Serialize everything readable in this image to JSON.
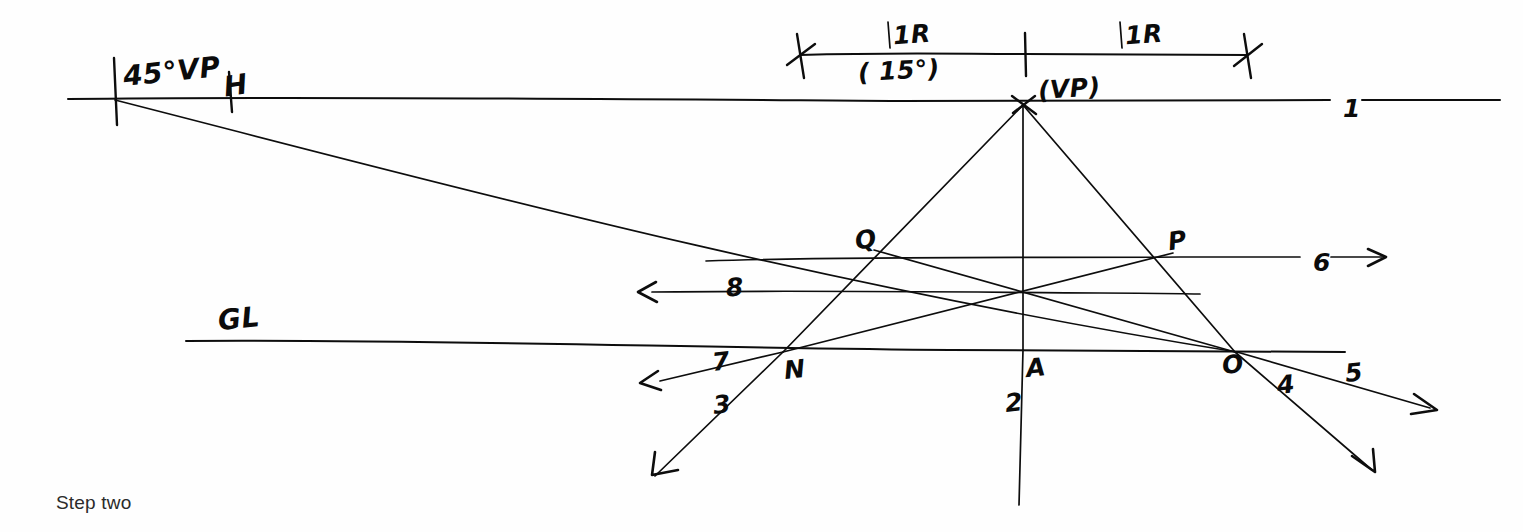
{
  "page": {
    "caption": "Step two",
    "caption_pos": {
      "x": 56,
      "y": 492
    },
    "width": 1523,
    "height": 532,
    "background": "#ffffff",
    "ink_color": "#0d0d0d"
  },
  "chart_data": {
    "type": "diagram",
    "title": "Step two",
    "labels": [
      {
        "id": "vp45",
        "text": "45°VP",
        "x": 123,
        "y": 58,
        "size": "lg",
        "rot": -6
      },
      {
        "id": "horizon_h",
        "text": "H",
        "x": 224,
        "y": 72,
        "size": "lg",
        "rot": -8
      },
      {
        "id": "measure_1r_left",
        "text": "1R",
        "x": 893,
        "y": 22,
        "size": "md",
        "rot": -4
      },
      {
        "id": "measure_15deg",
        "text": "( 15°)",
        "x": 858,
        "y": 58,
        "size": "md",
        "rot": -3
      },
      {
        "id": "measure_1r_right",
        "text": "1R",
        "x": 1125,
        "y": 22,
        "size": "md",
        "rot": -4
      },
      {
        "id": "vp_main",
        "text": "(VP)",
        "x": 1038,
        "y": 76,
        "size": "md",
        "rot": -4
      },
      {
        "id": "horizon_num",
        "text": "1",
        "x": 1343,
        "y": 96,
        "size": "md",
        "rot": 0
      },
      {
        "id": "point_q",
        "text": "Q",
        "x": 855,
        "y": 227,
        "size": "md",
        "rot": -8
      },
      {
        "id": "point_p",
        "text": "P",
        "x": 1168,
        "y": 228,
        "size": "md",
        "rot": -8
      },
      {
        "id": "line_6",
        "text": "6",
        "x": 1313,
        "y": 250,
        "size": "md",
        "rot": 0
      },
      {
        "id": "line_8",
        "text": "8",
        "x": 726,
        "y": 275,
        "size": "md",
        "rot": -4
      },
      {
        "id": "ground_line_gl",
        "text": "GL",
        "x": 218,
        "y": 305,
        "size": "lg",
        "rot": -6
      },
      {
        "id": "line_7",
        "text": "7",
        "x": 712,
        "y": 349,
        "size": "md",
        "rot": -6
      },
      {
        "id": "point_n",
        "text": "N",
        "x": 784,
        "y": 357,
        "size": "md",
        "rot": -6
      },
      {
        "id": "point_a",
        "text": "A",
        "x": 1026,
        "y": 355,
        "size": "md",
        "rot": -6
      },
      {
        "id": "point_o",
        "text": "O",
        "x": 1222,
        "y": 352,
        "size": "md",
        "rot": -6
      },
      {
        "id": "line_4",
        "text": "4",
        "x": 1277,
        "y": 372,
        "size": "md",
        "rot": -6
      },
      {
        "id": "line_5",
        "text": "5",
        "x": 1345,
        "y": 360,
        "size": "md",
        "rot": -6
      },
      {
        "id": "line_3",
        "text": "3",
        "x": 713,
        "y": 392,
        "size": "md",
        "rot": -6
      },
      {
        "id": "line_2",
        "text": "2",
        "x": 1005,
        "y": 390,
        "size": "md",
        "rot": -6
      }
    ],
    "key_points": {
      "vp45": {
        "x": 115,
        "y": 99
      },
      "vp": {
        "x": 1023,
        "y": 105
      },
      "Q": {
        "x": 874,
        "y": 250
      },
      "P": {
        "x": 1173,
        "y": 253
      },
      "N": {
        "x": 783,
        "y": 352
      },
      "A": {
        "x": 1023,
        "y": 350
      },
      "O": {
        "x": 1235,
        "y": 352
      },
      "center": {
        "x": 1023,
        "y": 292
      }
    },
    "strokes": [
      {
        "id": "horizon-line-left",
        "name": "horizon-line",
        "d": "M 68,99 C 300,96 620,99 900,101 C 1050,102 1200,101 1330,100",
        "w": "med"
      },
      {
        "id": "horizon-line-right",
        "name": "horizon-line-right-segment",
        "d": "M 1362,100 C 1420,100 1470,100 1500,100",
        "w": "med"
      },
      {
        "id": "measure-line",
        "name": "measurement-line",
        "d": "M 800,55 C 900,52 960,54 1025,54 C 1120,54 1200,55 1248,55",
        "w": "med"
      },
      {
        "id": "tick-measure-left-a",
        "name": "measure-tick-left",
        "d": "M 797,34 L 804,78",
        "w": "tick"
      },
      {
        "id": "tick-measure-left-b",
        "name": "measure-tick-left-cross",
        "d": "M 787,65 L 815,44",
        "w": "tick"
      },
      {
        "id": "tick-measure-mid",
        "name": "measure-tick-middle",
        "d": "M 1025,33 L 1026,76",
        "w": "tick"
      },
      {
        "id": "tick-measure-right-a",
        "name": "measure-tick-right",
        "d": "M 1244,34 L 1251,78",
        "w": "tick"
      },
      {
        "id": "tick-measure-right-b",
        "name": "measure-tick-right-cross",
        "d": "M 1234,66 L 1262,44",
        "w": "tick"
      },
      {
        "id": "tick-1r-left-small",
        "name": "unit-tick-left",
        "d": "M 888,22 L 890,48",
        "w": "thin"
      },
      {
        "id": "tick-1r-right-small",
        "name": "unit-tick-right",
        "d": "M 1120,22 L 1122,48",
        "w": "thin"
      },
      {
        "id": "tick-vp45",
        "name": "vp45-vertical-tick",
        "d": "M 114,58 L 117,125",
        "w": "tick"
      },
      {
        "id": "tick-h",
        "name": "h-marker-tick",
        "d": "M 229,72 L 232,112",
        "w": "tick"
      },
      {
        "id": "vp-cross-a",
        "name": "vp-cross-mark",
        "d": "M 1012,96 L 1036,114",
        "w": "tick"
      },
      {
        "id": "vp-cross-b",
        "name": "vp-cross-mark-2",
        "d": "M 1013,113 L 1035,96",
        "w": "tick"
      },
      {
        "id": "vp45-to-O",
        "name": "diagonal-45vp-to-O",
        "d": "M 115,100 C 420,178 800,282 1237,352",
        "w": "thin"
      },
      {
        "id": "vp-to-N",
        "name": "ray-vp-to-N-extended",
        "d": "M 1023,105 L 783,352 L 655,476",
        "w": "thin"
      },
      {
        "id": "vp-to-A",
        "name": "ray-vp-to-A-vertical",
        "d": "M 1023,105 L 1023,350",
        "w": "thin"
      },
      {
        "id": "A-to-2",
        "name": "vertical-line-2-below-A",
        "d": "M 1023,350 L 1019,505",
        "w": "thin"
      },
      {
        "id": "vp-to-O",
        "name": "ray-vp-to-O-extended",
        "d": "M 1023,105 L 1235,352 L 1372,470",
        "w": "thin"
      },
      {
        "id": "line-QP-horizontal",
        "name": "horizontal-line-6-through-QP",
        "d": "M 706,261 C 850,256 1050,258 1180,257 C 1260,257 1300,257 1300,257",
        "w": "thin"
      },
      {
        "id": "line-6-arrow-shaft",
        "name": "line-6-arrow-shaft",
        "d": "M 1331,257 L 1382,257",
        "w": "thin"
      },
      {
        "id": "line-6-arrowhead",
        "name": "line-6-arrowhead",
        "d": "M 1368,249 L 1386,257 L 1368,266",
        "w": "arrowhead"
      },
      {
        "id": "line-8-horizontal",
        "name": "horizontal-line-8",
        "d": "M 652,292 C 800,290 950,292 1100,293 C 1150,293 1190,294 1200,294",
        "w": "thin"
      },
      {
        "id": "line-8-arrowhead",
        "name": "line-8-arrowhead",
        "d": "M 656,282 L 638,292 L 657,302",
        "w": "arrowhead"
      },
      {
        "id": "diag-Q-to-right",
        "name": "diagonal-from-Q-through-center-to-O",
        "d": "M 874,250 L 1235,352",
        "w": "thin"
      },
      {
        "id": "diag-N-to-P",
        "name": "diagonal-from-N-through-center-to-P",
        "d": "M 783,352 L 1173,253",
        "w": "thin"
      },
      {
        "id": "ground-line",
        "name": "ground-line-GL",
        "d": "M 186,341 C 420,339 700,348 950,350 C 1100,351 1250,352 1345,352",
        "w": "med"
      },
      {
        "id": "line-7-shaft",
        "name": "line-7-arrow-shaft",
        "d": "M 783,352 L 660,381",
        "w": "thin"
      },
      {
        "id": "line-7-arrowhead",
        "name": "line-7-arrowhead",
        "d": "M 658,371 L 640,383 L 661,390",
        "w": "arrowhead"
      },
      {
        "id": "line-3-arrowhead",
        "name": "line-3-arrowhead",
        "d": "M 655,452 L 652,475 L 678,470",
        "w": "arrowhead"
      },
      {
        "id": "line-5-shaft",
        "name": "line-5-arrow-shaft",
        "d": "M 1237,352 L 1430,408",
        "w": "thin"
      },
      {
        "id": "line-5-arrowhead",
        "name": "line-5-arrowhead",
        "d": "M 1414,394 L 1437,410 L 1411,414",
        "w": "arrowhead"
      },
      {
        "id": "line-4-arrowhead",
        "name": "line-4-arrowhead",
        "d": "M 1352,456 L 1375,472 L 1373,449",
        "w": "arrowhead"
      }
    ]
  }
}
